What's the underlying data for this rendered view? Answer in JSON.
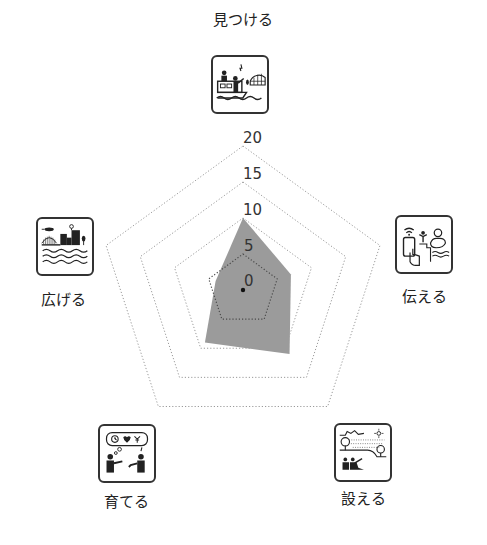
{
  "chart_data": {
    "type": "radar",
    "title": "",
    "axes": [
      "見つける",
      "伝える",
      "設える",
      "育てる",
      "広げる"
    ],
    "series": [
      {
        "name": "score",
        "values": [
          10,
          7,
          11,
          9,
          4
        ],
        "color": "#9b9b9b"
      }
    ],
    "radial_ticks": [
      0,
      5,
      10,
      15,
      20
    ],
    "rlim": [
      0,
      20
    ],
    "grid": "dotted pentagon",
    "legend": "none"
  },
  "axes_labels": {
    "top": "見つける",
    "right": "伝える",
    "bottom_right": "設える",
    "bottom_left": "育てる",
    "left": "広げる"
  },
  "icons": {
    "top": "boat-watch-icon",
    "right": "smartphone-share-icon",
    "bottom_right": "park-landscape-icon",
    "bottom_left": "people-talk-icon",
    "left": "city-waterfront-icon"
  },
  "ticks": {
    "t0": "0",
    "t5": "5",
    "t10": "10",
    "t15": "15",
    "t20": "20"
  },
  "colors": {
    "fill": "#9b9b9b",
    "grid": "#9a9a9a",
    "grid_inner": "#4a4a4a",
    "text": "#222222"
  }
}
